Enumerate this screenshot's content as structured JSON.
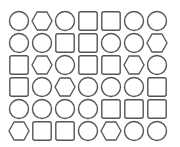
{
  "stroke_color": "#555555",
  "grid": {
    "rows": 6,
    "cols": 7,
    "cells": [
      [
        "circle",
        "hexagon",
        "circle",
        "square",
        "square",
        "circle",
        "circle"
      ],
      [
        "circle",
        "circle",
        "square",
        "square",
        "circle",
        "circle",
        "hexagon"
      ],
      [
        "square",
        "hexagon",
        "circle",
        "square",
        "square",
        "hexagon",
        "circle"
      ],
      [
        "square",
        "circle",
        "hexagon",
        "circle",
        "circle",
        "circle",
        "square"
      ],
      [
        "circle",
        "circle",
        "circle",
        "circle",
        "square",
        "square",
        "square"
      ],
      [
        "hexagon",
        "square",
        "square",
        "circle",
        "hexagon",
        "circle",
        "circle"
      ]
    ]
  }
}
